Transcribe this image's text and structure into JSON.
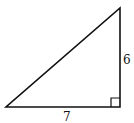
{
  "diagram": {
    "type": "right-triangle",
    "side_labels": {
      "vertical_leg": "6",
      "horizontal_leg": "7"
    },
    "right_angle_marker": true,
    "stroke_color": "#111111",
    "background": "#ffffff"
  }
}
